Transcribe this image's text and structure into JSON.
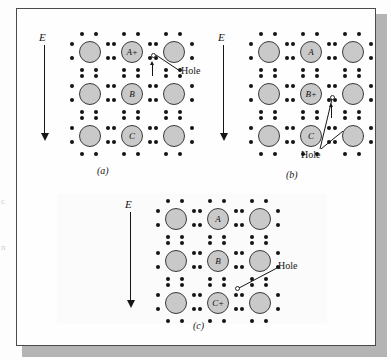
{
  "figure": {
    "margin_text": [
      {
        "text": "c"
      },
      {
        "text": "n"
      }
    ],
    "panels": [
      {
        "id": "a",
        "caption": "(a)",
        "field_label": "E",
        "hole_label": "Hole",
        "atoms": [
          {
            "label": ""
          },
          {
            "label": "A+"
          },
          {
            "label": ""
          },
          {
            "label": ""
          },
          {
            "label": "B"
          },
          {
            "label": ""
          },
          {
            "label": ""
          },
          {
            "label": "C"
          },
          {
            "label": ""
          }
        ]
      },
      {
        "id": "b",
        "caption": "(b)",
        "field_label": "E",
        "hole_label": "Hole",
        "atoms": [
          {
            "label": ""
          },
          {
            "label": "A"
          },
          {
            "label": ""
          },
          {
            "label": ""
          },
          {
            "label": "B+"
          },
          {
            "label": ""
          },
          {
            "label": ""
          },
          {
            "label": "C"
          },
          {
            "label": ""
          }
        ]
      },
      {
        "id": "c",
        "caption": "(c)",
        "field_label": "E",
        "hole_label": "Hole",
        "atoms": [
          {
            "label": ""
          },
          {
            "label": "A"
          },
          {
            "label": ""
          },
          {
            "label": ""
          },
          {
            "label": "B"
          },
          {
            "label": ""
          },
          {
            "label": ""
          },
          {
            "label": "C+"
          },
          {
            "label": ""
          }
        ]
      }
    ],
    "colors": {
      "atom_fill": "#c9c9c9",
      "atom_stroke": "#3a3a3a",
      "dot": "#141414",
      "ink": "#161616",
      "plate_border": "#4a4a4a",
      "plate_shadow": "#b4b4b4",
      "page": "#fdfdfd"
    }
  }
}
